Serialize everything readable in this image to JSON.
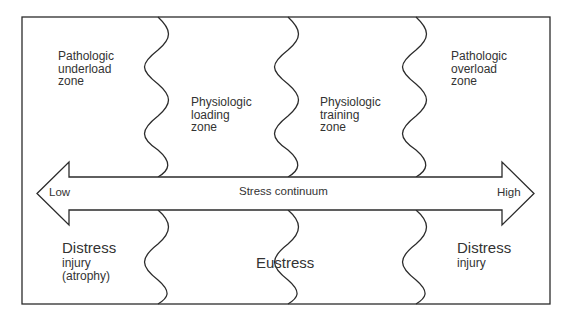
{
  "zones": {
    "top": [
      {
        "id": "pathologic-underload",
        "label": "Pathologic\nunderload\nzone"
      },
      {
        "id": "physiologic-loading",
        "label": "Physiologic\nloading\nzone"
      },
      {
        "id": "physiologic-training",
        "label": "Physiologic\ntraining\nzone"
      },
      {
        "id": "pathologic-overload",
        "label": "Pathologic\noverload\nzone"
      }
    ]
  },
  "arrow": {
    "label": "Stress continuum",
    "left_label": "Low",
    "right_label": "High"
  },
  "outcomes": {
    "left": {
      "title": "Distress",
      "detail": "injury\n(atrophy)"
    },
    "middle": {
      "title": "Eustress"
    },
    "right": {
      "title": "Distress",
      "detail": "injury"
    }
  },
  "colors": {
    "stroke": "#2b2b2b",
    "background": "#ffffff"
  }
}
